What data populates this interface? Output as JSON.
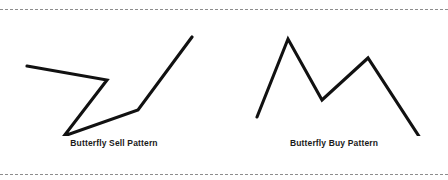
{
  "figure": {
    "background_color": "#ffffff",
    "stroke_color": "#111111",
    "rule_color": "#8d8d8d",
    "top_rule": "dashed-horizontal-rule",
    "bottom_rule": "dashed-horizontal-rule"
  },
  "panels": [
    {
      "id": "butterfly-sell",
      "caption": "Butterfly Sell Pattern",
      "direction": "sell",
      "points": "19,48 99,62 56,118 130,92 184,19",
      "vertices": [
        {
          "label": "X",
          "x": 19,
          "y": 48
        },
        {
          "label": "A",
          "x": 99,
          "y": 62
        },
        {
          "label": "B",
          "x": 56,
          "y": 118
        },
        {
          "label": "C",
          "x": 130,
          "y": 92
        },
        {
          "label": "D",
          "x": 184,
          "y": 19
        }
      ]
    },
    {
      "id": "butterfly-buy",
      "caption": "Butterfly Buy Pattern",
      "direction": "buy",
      "points": "29,99 60,21 94,82 140,40 196,126",
      "vertices": [
        {
          "label": "X",
          "x": 29,
          "y": 99
        },
        {
          "label": "A",
          "x": 60,
          "y": 21
        },
        {
          "label": "B",
          "x": 94,
          "y": 82
        },
        {
          "label": "C",
          "x": 140,
          "y": 40
        },
        {
          "label": "D",
          "x": 196,
          "y": 126
        }
      ]
    }
  ]
}
